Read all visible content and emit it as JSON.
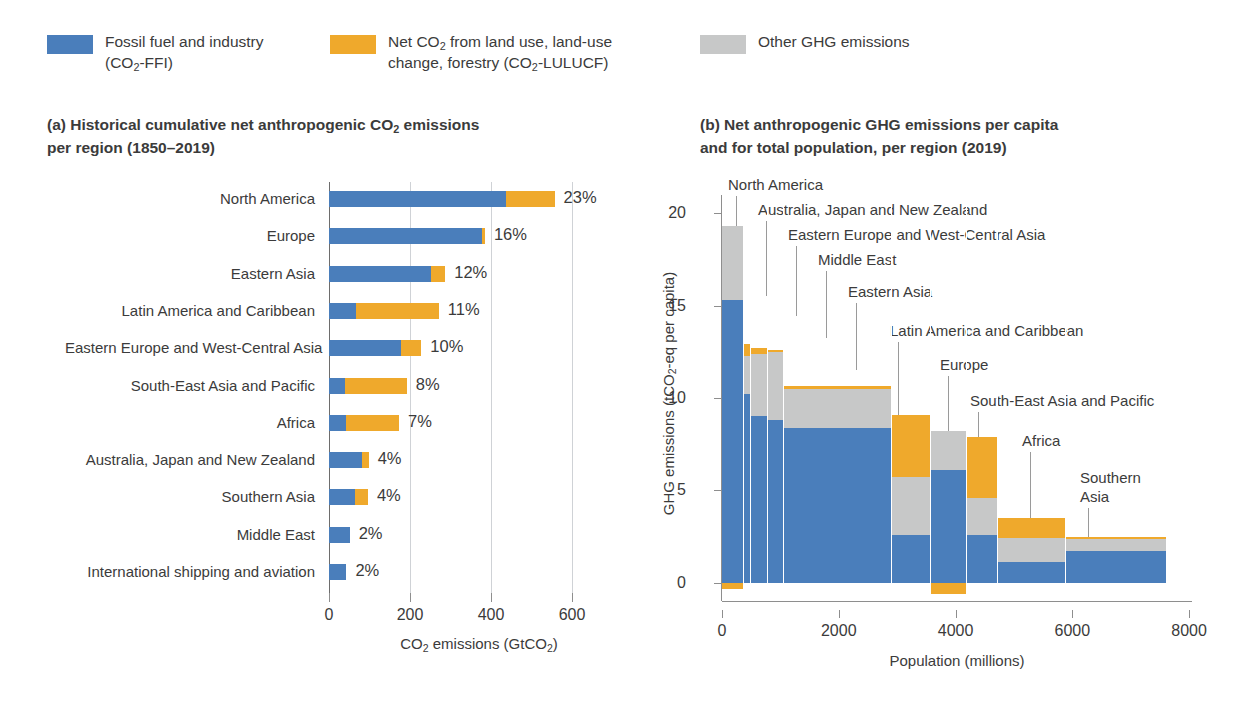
{
  "legend": {
    "items": [
      {
        "label_line1": "Fossil fuel and industry",
        "label_line2": "(CO₂-FFI)",
        "color": "#4A7EBB",
        "icon": "legend-swatch"
      },
      {
        "label_line1": "Net CO₂ from land use, land-use",
        "label_line2": "change, forestry (CO₂-LULUCF)",
        "color": "#EFA92C",
        "icon": "legend-swatch"
      },
      {
        "label_line1": "Other GHG emissions",
        "label_line2": "",
        "color": "#C7C8C8",
        "icon": "legend-swatch"
      }
    ]
  },
  "panel_a": {
    "title_line1": "(a) Historical cumulative net anthropogenic CO₂ emissions",
    "title_line2": "per region (1850–2019)"
  },
  "panel_b": {
    "title_line1": "(b) Net anthropogenic GHG emissions per capita",
    "title_line2": "and for total population, per region (2019)"
  },
  "colors": {
    "ffi": "#4A7EBB",
    "lulucf": "#EFA92C",
    "other_ghg": "#C7C8C8",
    "axis": "#8e8e8e",
    "grid": "#cfd2d6",
    "text": "#3b3b3b"
  },
  "chart_data": [
    {
      "type": "bar",
      "orientation": "horizontal",
      "stacked": true,
      "id": "panel-a",
      "title": "(a) Historical cumulative net anthropogenic CO2 emissions per region (1850–2019)",
      "xlabel": "CO₂ emissions (GtCO₂)",
      "ylabel": "",
      "xlim": [
        0,
        640
      ],
      "xticks": [
        0,
        200,
        400,
        600
      ],
      "ticklabels": [
        "0",
        "200",
        "400",
        "600"
      ],
      "grid": true,
      "legend_position": "top",
      "series": [
        {
          "name": "Fossil fuel and industry (CO₂-FFI)",
          "color": "#4A7EBB"
        },
        {
          "name": "Net CO₂ from land use, land-use change, forestry (CO₂-LULUCF)",
          "color": "#EFA92C"
        }
      ],
      "categories": [
        "North America",
        "Europe",
        "Eastern Asia",
        "Latin America and Caribbean",
        "Eastern Europe and West-Central Asia",
        "South-East Asia and Pacific",
        "Africa",
        "Australia, Japan and New Zealand",
        "Southern Asia",
        "Middle East",
        "International shipping and aviation"
      ],
      "data_labels": [
        "23%",
        "16%",
        "12%",
        "11%",
        "10%",
        "8%",
        "7%",
        "4%",
        "4%",
        "2%",
        "2%"
      ],
      "rows": [
        {
          "category": "North America",
          "ffi": 437,
          "lulucf": 120,
          "total": 557,
          "pct": "23%"
        },
        {
          "category": "Europe",
          "ffi": 379,
          "lulucf": 6,
          "total": 385,
          "pct": "16%"
        },
        {
          "category": "Eastern Asia",
          "ffi": 252,
          "lulucf": 35,
          "total": 287,
          "pct": "12%"
        },
        {
          "category": "Latin America and Caribbean",
          "ffi": 66,
          "lulucf": 205,
          "total": 271,
          "pct": "11%"
        },
        {
          "category": "Eastern Europe and West-Central Asia",
          "ffi": 178,
          "lulucf": 50,
          "total": 228,
          "pct": "10%"
        },
        {
          "category": "South-East Asia and Pacific",
          "ffi": 40,
          "lulucf": 152,
          "total": 192,
          "pct": "8%"
        },
        {
          "category": "Africa",
          "ffi": 43,
          "lulucf": 130,
          "total": 173,
          "pct": "7%"
        },
        {
          "category": "Australia, Japan and New Zealand",
          "ffi": 81,
          "lulucf": 17,
          "total": 98,
          "pct": "4%"
        },
        {
          "category": "Southern Asia",
          "ffi": 63,
          "lulucf": 33,
          "total": 96,
          "pct": "4%"
        },
        {
          "category": "Middle East",
          "ffi": 51,
          "lulucf": 0,
          "total": 51,
          "pct": "2%"
        },
        {
          "category": "International shipping and aviation",
          "ffi": 43,
          "lulucf": 0,
          "total": 43,
          "pct": "2%"
        }
      ]
    },
    {
      "type": "bar",
      "orientation": "vertical",
      "stacked": true,
      "variable_width": true,
      "id": "panel-b",
      "title": "(b) Net anthropogenic GHG emissions per capita and for total population, per region (2019)",
      "xlabel": "Population (millions)",
      "ylabel": "GHG emissions (tCO₂-eq per capita)",
      "xlim": [
        0,
        8050
      ],
      "ylim": [
        -1.0,
        21.0
      ],
      "xticks": [
        0,
        2000,
        4000,
        6000,
        8000
      ],
      "xticklabels": [
        "0",
        "2000",
        "4000",
        "6000",
        "8000"
      ],
      "yticks": [
        0,
        5,
        10,
        15,
        20
      ],
      "yticklabels": [
        "0",
        "5",
        "10",
        "15",
        "20"
      ],
      "grid": false,
      "legend_position": "top",
      "series": [
        {
          "name": "Fossil fuel and industry (CO₂-FFI)",
          "color": "#4A7EBB"
        },
        {
          "name": "Net CO₂ from land use, land-use change, forestry (CO₂-LULUCF)",
          "color": "#EFA92C"
        },
        {
          "name": "Other GHG emissions",
          "color": "#C7C8C8"
        }
      ],
      "bars": [
        {
          "category": "North America",
          "pop_start": 0,
          "pop_end": 370,
          "ffi": 15.3,
          "other_ghg": 4.0,
          "lulucf": -0.35,
          "total": 19.3
        },
        {
          "category": "Australia, Japan and New Zealand",
          "pop_start": 370,
          "pop_end": 500,
          "ffi": 10.2,
          "other_ghg": 2.1,
          "lulucf": 0.6,
          "total": 12.9
        },
        {
          "category": "Eastern Europe and West-Central Asia",
          "pop_start": 500,
          "pop_end": 790,
          "ffi": 9.0,
          "other_ghg": 3.4,
          "lulucf": 0.3,
          "total": 12.7
        },
        {
          "category": "Middle East",
          "pop_start": 790,
          "pop_end": 1060,
          "ffi": 8.8,
          "other_ghg": 3.7,
          "lulucf": 0.1,
          "total": 12.6
        },
        {
          "category": "Eastern Asia",
          "pop_start": 1060,
          "pop_end": 2920,
          "ffi": 8.4,
          "other_ghg": 2.1,
          "lulucf": 0.15,
          "total": 10.6
        },
        {
          "category": "Latin America and Caribbean",
          "pop_start": 2920,
          "pop_end": 3580,
          "ffi": 2.6,
          "other_ghg": 3.1,
          "lulucf": 3.4,
          "total": 9.1
        },
        {
          "category": "Europe",
          "pop_start": 3580,
          "pop_end": 4190,
          "ffi": 6.1,
          "other_ghg": 2.1,
          "lulucf": -0.6,
          "total": 8.2
        },
        {
          "category": "South-East Asia and Pacific",
          "pop_start": 4190,
          "pop_end": 4730,
          "ffi": 2.6,
          "other_ghg": 2.0,
          "lulucf": 3.3,
          "total": 7.9
        },
        {
          "category": "Africa",
          "pop_start": 4730,
          "pop_end": 5900,
          "ffi": 1.1,
          "other_ghg": 1.3,
          "lulucf": 1.1,
          "total": 3.5
        },
        {
          "category": "Southern Asia",
          "pop_start": 5900,
          "pop_end": 7620,
          "ffi": 1.7,
          "other_ghg": 0.65,
          "lulucf": 0.1,
          "total": 2.45
        }
      ],
      "annotations": [
        "North America",
        "Australia, Japan and New Zealand",
        "Eastern Europe and West-Central Asia",
        "Middle East",
        "Eastern Asia",
        "Latin America and Caribbean",
        "Europe",
        "South-East Asia and Pacific",
        "Africa",
        "Southern Asia"
      ]
    }
  ]
}
